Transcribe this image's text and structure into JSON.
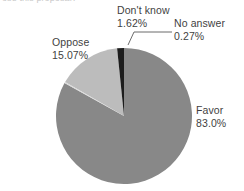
{
  "header": {
    "clipped_text": "ose this proposal?"
  },
  "chart_data": {
    "type": "pie",
    "title": "",
    "subtitle": "",
    "xlabel": "",
    "ylabel": "",
    "grid": false,
    "legend_position": "none",
    "labels_position": "outside-callout",
    "background": "#ffffff",
    "categories": [
      "Favor",
      "Oppose",
      "Don't know",
      "No answer"
    ],
    "values": [
      83.0,
      15.07,
      1.62,
      0.27
    ],
    "value_labels": [
      "83.0%",
      "15.07%",
      "1.62%",
      "0.27%"
    ],
    "colors": [
      "#888888",
      "#bcbcbc",
      "#1c1c1c",
      "#d8d8d8"
    ],
    "units": "percent",
    "start_angle_deg": -90,
    "direction": "clockwise",
    "slices": [
      {
        "name": "Favor",
        "value": 83.0,
        "value_label": "83.0%",
        "color": "#888888",
        "label_text": "Favor",
        "has_callout": false
      },
      {
        "name": "Oppose",
        "value": 15.07,
        "value_label": "15.07%",
        "color": "#bcbcbc",
        "label_text": "Oppose",
        "has_callout": false
      },
      {
        "name": "Don't know",
        "value": 1.62,
        "value_label": "1.62%",
        "color": "#1c1c1c",
        "label_text": "Don't know",
        "has_callout": false
      },
      {
        "name": "No answer",
        "value": 0.27,
        "value_label": "0.27%",
        "color": "#d8d8d8",
        "label_text": "No answer",
        "has_callout": true
      }
    ]
  },
  "labels": {
    "dontknow": {
      "name": "Don't know",
      "pct": "1.62%"
    },
    "noanswer": {
      "name": "No answer",
      "pct": "0.27%"
    },
    "oppose": {
      "name": "Oppose",
      "pct": "15.07%"
    },
    "favor": {
      "name": "Favor",
      "pct": "83.0%"
    }
  }
}
